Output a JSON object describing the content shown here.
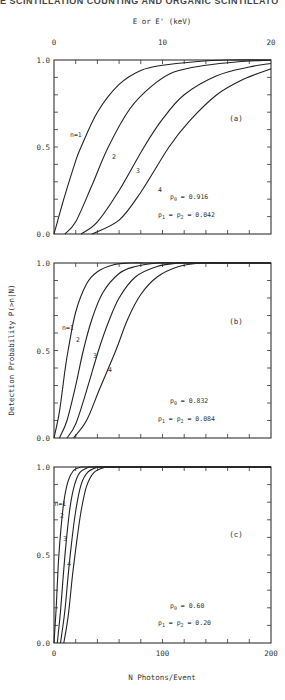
{
  "header": {
    "running_title": "E SCINTILLATION COUNTING AND ORGANIC SCINTILLATO"
  },
  "chart_data": [
    {
      "type": "line",
      "panel": "(a)",
      "title": "",
      "top_axis": {
        "label": "E or E' (keV)",
        "ticks": [
          "0",
          "10",
          "20"
        ],
        "range": [
          0,
          20
        ]
      },
      "xlabel": "N Photons/Event",
      "ylabel": "Detection Probability P(>n|N)",
      "xlim": [
        0,
        200
      ],
      "ylim": [
        0,
        1
      ],
      "yticks": [
        "0.0",
        "0.5",
        "1.0"
      ],
      "annotation": {
        "p0": "p0 = 0.916",
        "p12": "p1 = p2 = 0.042"
      },
      "series": [
        {
          "name": "n=1",
          "x": [
            0,
            10,
            20,
            25,
            40,
            60,
            80,
            100,
            130,
            160,
            200
          ],
          "y": [
            0,
            0.22,
            0.42,
            0.5,
            0.7,
            0.86,
            0.94,
            0.97,
            0.99,
            1.0,
            1.0
          ]
        },
        {
          "name": "2",
          "x": [
            10,
            20,
            35,
            50,
            70,
            90,
            110,
            140,
            170,
            200
          ],
          "y": [
            0,
            0.07,
            0.28,
            0.5,
            0.72,
            0.85,
            0.93,
            0.97,
            0.99,
            1.0
          ]
        },
        {
          "name": "3",
          "x": [
            25,
            40,
            60,
            83,
            100,
            120,
            150,
            180,
            200
          ],
          "y": [
            0,
            0.07,
            0.25,
            0.5,
            0.66,
            0.8,
            0.91,
            0.96,
            0.98
          ]
        },
        {
          "name": "4",
          "x": [
            35,
            60,
            80,
            106,
            125,
            150,
            175,
            200
          ],
          "y": [
            0,
            0.08,
            0.24,
            0.5,
            0.65,
            0.8,
            0.89,
            0.95
          ]
        }
      ]
    },
    {
      "type": "line",
      "panel": "(b)",
      "xlim": [
        0,
        200
      ],
      "ylim": [
        0,
        1
      ],
      "yticks": [
        "0.0",
        "0.5",
        "1.0"
      ],
      "annotation": {
        "p0": "p0 = 0.832",
        "p12": "p1 = p2 = 0.084"
      },
      "series": [
        {
          "name": "n=1",
          "x": [
            0,
            5,
            10,
            13,
            20,
            30,
            40,
            55,
            70,
            90
          ],
          "y": [
            0,
            0.15,
            0.38,
            0.5,
            0.72,
            0.88,
            0.95,
            0.99,
            1.0,
            1.0
          ]
        },
        {
          "name": "2",
          "x": [
            5,
            12,
            20,
            27,
            35,
            45,
            60,
            75,
            95,
            110
          ],
          "y": [
            0,
            0.1,
            0.3,
            0.5,
            0.68,
            0.83,
            0.94,
            0.98,
            1.0,
            1.0
          ]
        },
        {
          "name": "3",
          "x": [
            12,
            20,
            30,
            41,
            50,
            60,
            75,
            95,
            115,
            130
          ],
          "y": [
            0,
            0.08,
            0.27,
            0.5,
            0.66,
            0.8,
            0.92,
            0.98,
            1.0,
            1.0
          ]
        },
        {
          "name": "4",
          "x": [
            18,
            30,
            42,
            57,
            68,
            80,
            95,
            115,
            135,
            155
          ],
          "y": [
            0,
            0.1,
            0.28,
            0.5,
            0.68,
            0.82,
            0.92,
            0.98,
            1.0,
            1.0
          ]
        }
      ]
    },
    {
      "type": "line",
      "panel": "(c)",
      "xlabel": "N Photons/Event",
      "xticks": [
        "0",
        "100",
        "200"
      ],
      "xlim": [
        0,
        200
      ],
      "ylim": [
        0,
        1
      ],
      "yticks": [
        "0.0",
        "0.5",
        "1.0"
      ],
      "annotation": {
        "p0": "p0 = 0.60",
        "p12": "p1 = p2 = 0.20"
      },
      "series": [
        {
          "name": "n=1",
          "x": [
            0,
            2,
            4,
            6,
            9,
            13,
            18,
            25
          ],
          "y": [
            0,
            0.2,
            0.45,
            0.62,
            0.8,
            0.92,
            0.98,
            1.0
          ]
        },
        {
          "name": "2",
          "x": [
            3,
            6,
            9,
            12,
            15,
            19,
            24,
            32
          ],
          "y": [
            0,
            0.18,
            0.42,
            0.62,
            0.78,
            0.9,
            0.97,
            1.0
          ]
        },
        {
          "name": "3",
          "x": [
            6,
            10,
            13,
            16,
            20,
            25,
            31,
            40
          ],
          "y": [
            0,
            0.18,
            0.38,
            0.56,
            0.75,
            0.9,
            0.97,
            1.0
          ]
        },
        {
          "name": "4",
          "x": [
            9,
            13,
            17,
            21,
            25,
            30,
            37,
            48
          ],
          "y": [
            0,
            0.15,
            0.38,
            0.58,
            0.75,
            0.89,
            0.97,
            1.0
          ]
        }
      ]
    }
  ],
  "labels": {
    "top_axis_title": "E or E' (keV)",
    "top_ticks": [
      "0",
      "10",
      "20"
    ],
    "x_axis_title": "N Photons/Event",
    "x_ticks": [
      "0",
      "100",
      "200"
    ],
    "y_axis_title": "Detection Probability P(>n|N)",
    "y_ticks": [
      "0.0",
      "0.5",
      "1.0"
    ],
    "panel_a": "(a)",
    "panel_b": "(b)",
    "panel_c": "(c)",
    "a_p0": "= 0.916",
    "a_p12": "= 0.042",
    "b_p0": "= 0.832",
    "b_p12": "= 0.084",
    "c_p0": "= 0.60",
    "c_p12": "= 0.20",
    "curve_labels": [
      "n=1",
      "2",
      "3",
      "4"
    ]
  }
}
